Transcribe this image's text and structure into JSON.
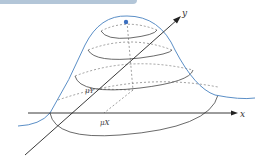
{
  "figure": {
    "labels": {
      "x_axis": "x",
      "y_axis": "y",
      "mu_x": "μX",
      "mu_y": "μY"
    },
    "colors": {
      "curve": "#5b8fc7",
      "peak_dot": "#3b6fc0",
      "axes": "#222222",
      "ellipses": "#444444",
      "top_bar": "#b3c6d8"
    }
  }
}
